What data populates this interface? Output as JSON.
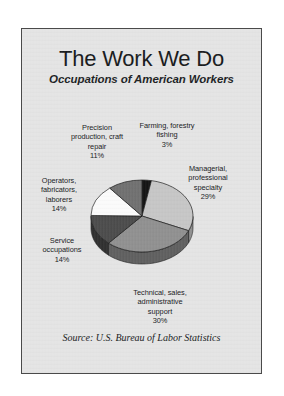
{
  "panel": {
    "title": "The Work We Do",
    "subtitle": "Occupations of American Workers",
    "source": "Source:  U.S. Bureau of Labor Statistics",
    "background_color": "#e4e4e4",
    "border_color": "#4a4a4a"
  },
  "labels": {
    "precision": {
      "name": "Precision\nproduction, craft\nrepair",
      "pct": "11%"
    },
    "farming": {
      "name": "Farming, forestry\nfishing",
      "pct": "3%"
    },
    "managerial": {
      "name": "Managerial,\nprofessional\nspecialty",
      "pct": "29%"
    },
    "operators": {
      "name": "Operators,\nfabricators,\nlaborers",
      "pct": "14%"
    },
    "service": {
      "name": "Service\noccupations",
      "pct": "14%"
    },
    "technical": {
      "name": "Technical, sales,\nadministrative\nsupport",
      "pct": "30%"
    }
  },
  "chart_data": {
    "type": "pie",
    "title": "The Work We Do",
    "subtitle": "Occupations of American Workers",
    "source": "Source:  U.S. Bureau of Labor Statistics",
    "three_d": true,
    "start_angle_deg": -90,
    "direction": "clockwise",
    "categories": [
      "Farming, forestry fishing",
      "Managerial, professional specialty",
      "Technical, sales, administrative support",
      "Service occupations",
      "Operators, fabricators, laborers",
      "Precision production, craft repair"
    ],
    "values": [
      3,
      29,
      30,
      14,
      14,
      11
    ],
    "unit": "percent",
    "total": 101,
    "colors": [
      "#121212",
      "#c6c6c6",
      "#8f8f8f",
      "#4a4a4a",
      "#fbfbfb",
      "#6f6f6f"
    ],
    "side_colors": [
      "#000000",
      "#8e8e8e",
      "#5e5e5e",
      "#2e2e2e",
      "#b9b9b9",
      "#4a4a4a"
    ],
    "legend": "none",
    "labels_position": "outside-callout",
    "grid": false
  }
}
